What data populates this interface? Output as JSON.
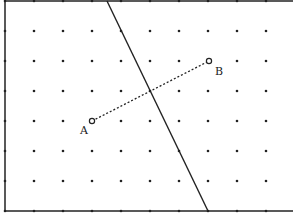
{
  "diagram": {
    "type": "dot-grid-geometry",
    "grid": {
      "columns_x": [
        5,
        34,
        63,
        92,
        121,
        150,
        179,
        208,
        237,
        266
      ],
      "rows_y": [
        1,
        31,
        61,
        91,
        121,
        151,
        181,
        211
      ],
      "dot_color": "#222222"
    },
    "border": {
      "left_x": 5,
      "top_y": 1,
      "bottom_y": 211,
      "right_x": 293,
      "color": "#222222"
    },
    "points": [
      {
        "label": "A",
        "x": 92,
        "y": 121,
        "label_x": 80,
        "label_y": 134
      },
      {
        "label": "B",
        "x": 209,
        "y": 61,
        "label_x": 215,
        "label_y": 75
      }
    ],
    "segment_AB": {
      "style": "dotted",
      "from": "A",
      "to": "B",
      "color": "#222222"
    },
    "mirror_line": {
      "style": "solid",
      "x1": 107,
      "y1": 1,
      "x2": 208,
      "y2": 211,
      "color": "#222222"
    }
  }
}
